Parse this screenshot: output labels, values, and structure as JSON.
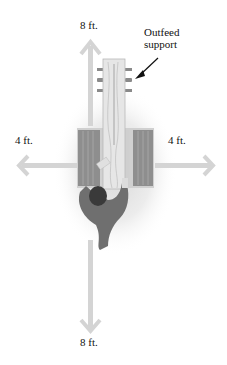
{
  "diagram": {
    "labels": {
      "top": "8 ft.",
      "bottom": "8 ft.",
      "left": "4 ft.",
      "right": "4 ft.",
      "callout_line1": "Outfeed",
      "callout_line2": "support"
    },
    "colors": {
      "arrow": "#d4d4d4",
      "table": "#8e8e8e",
      "board": "#e6e6e6",
      "person": "#6f6f6f",
      "head": "#3a3a3a",
      "shadow": "#e9e9e9",
      "pointer": "#111111"
    }
  }
}
